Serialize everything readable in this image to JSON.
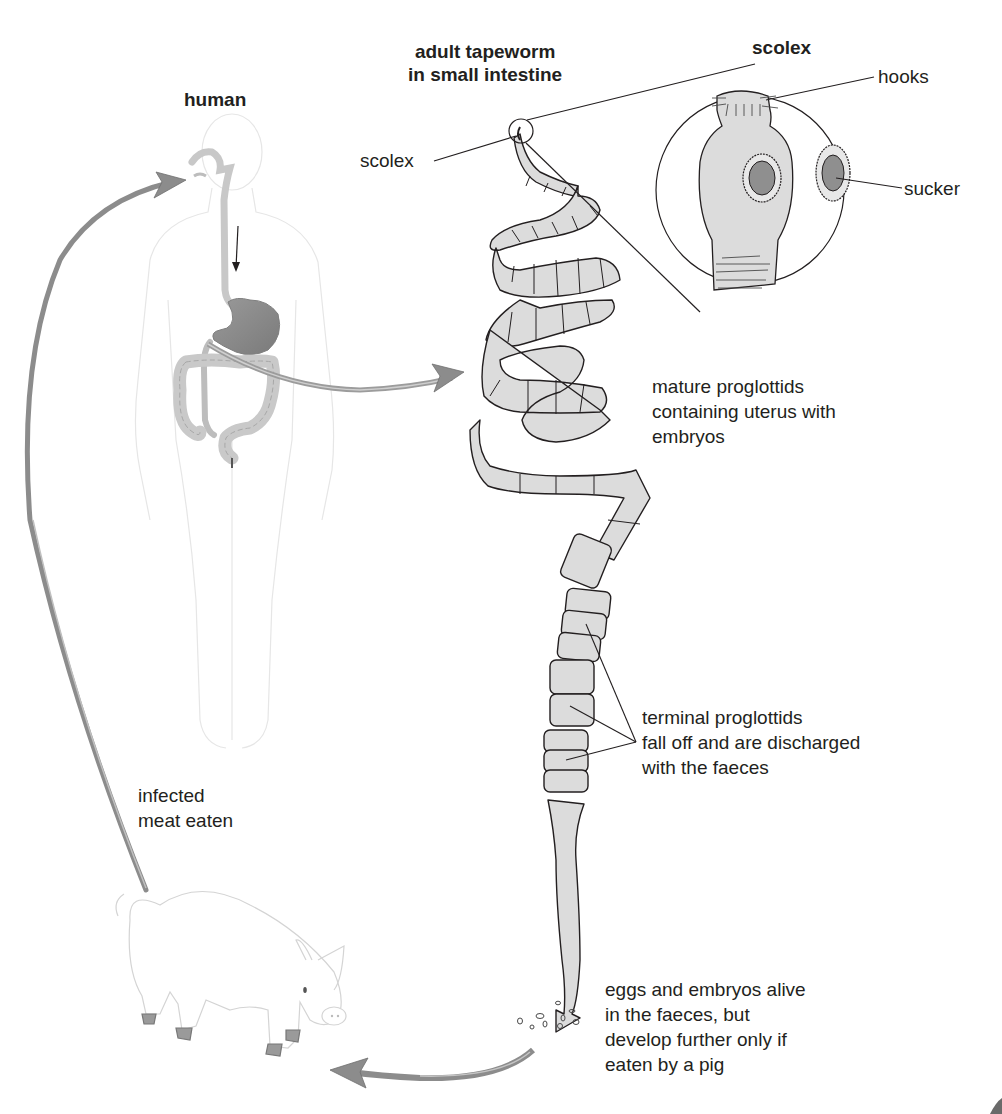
{
  "diagram": {
    "colors": {
      "arrow_fill": "#8c8c8c",
      "organ_stomach": "#8a8a8a",
      "organ_light": "#c4c4c4",
      "segment_fill": "#dcdcdc",
      "outline": "#231f20",
      "faint_outline": "#e2e2e2",
      "sucker_center": "#8f8f8f"
    }
  },
  "labels": {
    "human": "human",
    "adult_tapeworm": "adult tapeworm\nin small intestine",
    "scolex_title": "scolex",
    "scolex_pointer": "scolex",
    "hooks": "hooks",
    "sucker": "sucker",
    "mature_proglottids": "mature proglottids\ncontaining uterus with\nembryos",
    "terminal_proglottids": "terminal proglottids\nfall off and are discharged\nwith the faeces",
    "infected_meat": "infected\nmeat eaten",
    "eggs_embryos": "eggs and embryos alive\nin the faeces, but\ndevelop further only if\neaten by a pig"
  },
  "figures": {
    "human": "human-body-with-digestive-tract",
    "tapeworm": "coiled-adult-tapeworm",
    "scolex_detail": "magnified-scolex-circle",
    "pig": "pig-intermediate-host"
  },
  "flow": [
    {
      "from": "pig",
      "to": "human",
      "label": "infected meat eaten"
    },
    {
      "from": "human",
      "to": "adult tapeworm",
      "label": "adult tapeworm in small intestine"
    },
    {
      "from": "adult tapeworm",
      "to": "faeces",
      "label": "terminal proglottids fall off and are discharged with the faeces"
    },
    {
      "from": "faeces",
      "to": "pig",
      "label": "eggs and embryos alive in the faeces, but develop further only if eaten by a pig"
    }
  ]
}
